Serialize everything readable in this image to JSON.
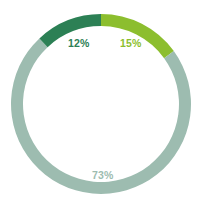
{
  "chart_data": {
    "type": "pie",
    "variant": "donut",
    "title": "",
    "subtitle": "",
    "xlabel": "",
    "ylabel": "",
    "legend": "none",
    "grid": false,
    "background": "#ffffff",
    "units": "percent",
    "total": 100,
    "start_angle_deg": 0,
    "direction": "clockwise",
    "inner_radius_ratio": 0.865,
    "categories": [
      "Segment 1",
      "Segment 2",
      "Segment 3"
    ],
    "values": [
      15,
      73,
      12
    ],
    "slices": [
      {
        "label": "15%",
        "value": 15,
        "color": "#8CBE2E",
        "label_color": "#8CBE2E",
        "start_deg": 0,
        "end_deg": 54
      },
      {
        "label": "73%",
        "value": 73,
        "color": "#9DBCB0",
        "label_color": "#9DBCB0",
        "start_deg": 54,
        "end_deg": 316.8
      },
      {
        "label": "12%",
        "value": 12,
        "color": "#2C8055",
        "label_color": "#2C8055",
        "start_deg": 316.8,
        "end_deg": 360
      }
    ],
    "geometry": {
      "center_x": 101,
      "center_y": 104,
      "outer_radius": 90,
      "ring_thickness": 12
    }
  }
}
